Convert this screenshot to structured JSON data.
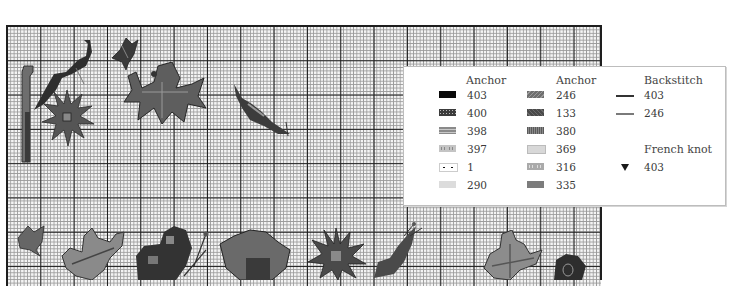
{
  "chart": {
    "grid": {
      "major_every_cells": 10,
      "minor_cell_px": 3.33,
      "line_color": "#1e1e1e",
      "minor_color": "#9a9a9a"
    },
    "motifs": [
      {
        "name": "crochet-hook",
        "position": "top-left"
      },
      {
        "name": "leaf-sprig",
        "position": "top-left"
      },
      {
        "name": "sunflower",
        "position": "top-left"
      },
      {
        "name": "tulip-bud",
        "position": "top"
      },
      {
        "name": "lily-flower",
        "position": "top"
      },
      {
        "name": "curled-leaf",
        "position": "top-center"
      },
      {
        "name": "rosebud",
        "position": "bottom-left"
      },
      {
        "name": "oak-leaf",
        "position": "bottom-left"
      },
      {
        "name": "butterfly",
        "position": "bottom"
      },
      {
        "name": "pansy",
        "position": "bottom"
      },
      {
        "name": "daisy",
        "position": "bottom"
      },
      {
        "name": "snail-leaf",
        "position": "bottom"
      },
      {
        "name": "maple-leaf",
        "position": "bottom-right"
      },
      {
        "name": "violet",
        "position": "bottom-right"
      }
    ]
  },
  "legend": {
    "columns": [
      {
        "header": "Anchor",
        "rows": [
          {
            "symbol": "solid",
            "color": "#0a0a0a",
            "value": "403"
          },
          {
            "symbol": "dots-grid",
            "color": "#3c3c3c",
            "value": "400"
          },
          {
            "symbol": "double-dash",
            "color": "#8a8a8a",
            "value": "398"
          },
          {
            "symbol": "circles",
            "color": "#c4c4c4",
            "value": "397"
          },
          {
            "symbol": "dots",
            "color": "#ffffff",
            "value": "1"
          },
          {
            "symbol": "triangles",
            "color": "#dcdcdc",
            "value": "290"
          }
        ]
      },
      {
        "header": "Anchor",
        "rows": [
          {
            "symbol": "slashes",
            "color": "#6e6e6e",
            "value": "246"
          },
          {
            "symbol": "backslashes",
            "color": "#4a4a4a",
            "value": "133"
          },
          {
            "symbol": "hatch",
            "color": "#5a5a5a",
            "value": "380"
          },
          {
            "symbol": "carets",
            "color": "#d0d0d0",
            "value": "369"
          },
          {
            "symbol": "circles",
            "color": "#aaaaaa",
            "value": "316"
          },
          {
            "symbol": "crosses",
            "color": "#7c7c7c",
            "value": "335"
          }
        ]
      }
    ],
    "backstitch": {
      "header": "Backstitch",
      "rows": [
        {
          "line_color": "#333333",
          "value": "403"
        },
        {
          "line_color": "#7a7a7a",
          "value": "246"
        }
      ]
    },
    "french_knot": {
      "header": "French knot",
      "rows": [
        {
          "symbol": "knot-icon",
          "value": "403"
        }
      ]
    }
  }
}
